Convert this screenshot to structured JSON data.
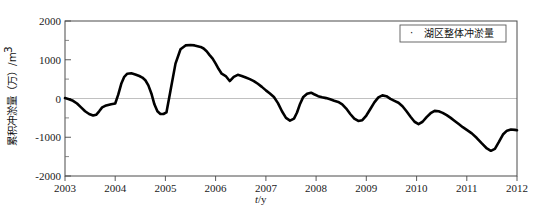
{
  "figure": {
    "background": "#ffffff",
    "series_color": "#000000",
    "axis_color": "#4a4a4a"
  },
  "legend": {
    "marker": "·",
    "label": "湖区整体冲淤量",
    "position": "top-right"
  },
  "axis": {
    "y_title": "累积冲淤量（万）/m³",
    "y_title_main": "累积冲淤量（万）/m",
    "y_title_sup": "3",
    "x_title_italic": "t",
    "x_title_rest": "/y"
  },
  "caption": {
    "text": ""
  },
  "chart_data": {
    "type": "line",
    "title": "",
    "subtitle": "",
    "xlabel": "t/y",
    "ylabel": "累积冲淤量（万）/m³",
    "xlim": [
      2003,
      2012
    ],
    "ylim": [
      -2000,
      2000
    ],
    "yticks": [
      -2000,
      -1000,
      0,
      1000,
      2000
    ],
    "ytick_labels": [
      "-2000",
      "-1000",
      "0",
      "1000",
      "2000"
    ],
    "yminor_step": 500,
    "xticks": [
      2003,
      2004,
      2005,
      2006,
      2007,
      2008,
      2009,
      2010,
      2011,
      2012
    ],
    "xtick_labels": [
      "2003",
      "2004",
      "2005",
      "2006",
      "2007",
      "2008",
      "2009",
      "2010",
      "2011",
      "2012"
    ],
    "grid": false,
    "legend_position": "upper right",
    "series": [
      {
        "name": "湖区整体冲淤量",
        "marker": "dot",
        "color": "#000000",
        "x": [
          2003.0,
          2003.08,
          2003.16,
          2003.24,
          2003.32,
          2003.4,
          2003.48,
          2003.56,
          2003.62,
          2003.68,
          2003.74,
          2003.8,
          2003.86,
          2003.92,
          2004.0,
          2004.06,
          2004.12,
          2004.18,
          2004.24,
          2004.32,
          2004.4,
          2004.48,
          2004.54,
          2004.6,
          2004.66,
          2004.72,
          2004.78,
          2004.84,
          2004.9,
          2004.96,
          2005.02,
          2005.1,
          2005.2,
          2005.3,
          2005.4,
          2005.5,
          2005.58,
          2005.64,
          2005.7,
          2005.76,
          2005.82,
          2005.88,
          2005.94,
          2006.0,
          2006.06,
          2006.12,
          2006.2,
          2006.28,
          2006.36,
          2006.44,
          2006.52,
          2006.6,
          2006.68,
          2006.76,
          2006.84,
          2006.92,
          2007.0,
          2007.08,
          2007.16,
          2007.24,
          2007.32,
          2007.4,
          2007.48,
          2007.56,
          2007.62,
          2007.68,
          2007.74,
          2007.82,
          2007.9,
          2007.96,
          2008.04,
          2008.12,
          2008.2,
          2008.28,
          2008.36,
          2008.44,
          2008.52,
          2008.6,
          2008.68,
          2008.76,
          2008.84,
          2008.92,
          2009.0,
          2009.08,
          2009.16,
          2009.24,
          2009.32,
          2009.4,
          2009.48,
          2009.56,
          2009.64,
          2009.72,
          2009.8,
          2009.88,
          2009.96,
          2010.04,
          2010.12,
          2010.2,
          2010.28,
          2010.36,
          2010.44,
          2010.52,
          2010.6,
          2010.68,
          2010.76,
          2010.84,
          2010.92,
          2011.0,
          2011.1,
          2011.2,
          2011.3,
          2011.4,
          2011.48,
          2011.56,
          2011.64,
          2011.72,
          2011.8,
          2011.88,
          2011.96,
          2012.0
        ],
        "y": [
          10,
          -20,
          -60,
          -130,
          -230,
          -330,
          -400,
          -440,
          -420,
          -330,
          -230,
          -190,
          -170,
          -150,
          -130,
          100,
          380,
          560,
          640,
          650,
          620,
          580,
          540,
          470,
          340,
          130,
          -150,
          -330,
          -400,
          -400,
          -360,
          200,
          900,
          1270,
          1370,
          1380,
          1370,
          1350,
          1330,
          1290,
          1220,
          1120,
          1030,
          900,
          760,
          640,
          580,
          450,
          560,
          610,
          580,
          540,
          500,
          450,
          380,
          300,
          210,
          130,
          40,
          -120,
          -330,
          -500,
          -570,
          -520,
          -360,
          -140,
          30,
          120,
          150,
          110,
          60,
          30,
          10,
          -20,
          -60,
          -90,
          -150,
          -260,
          -400,
          -520,
          -580,
          -560,
          -440,
          -270,
          -100,
          30,
          80,
          60,
          -10,
          -60,
          -110,
          -200,
          -330,
          -470,
          -600,
          -660,
          -600,
          -480,
          -380,
          -320,
          -330,
          -370,
          -430,
          -500,
          -580,
          -660,
          -740,
          -810,
          -900,
          -1020,
          -1160,
          -1290,
          -1350,
          -1300,
          -1120,
          -930,
          -830,
          -800,
          -810,
          -820
        ]
      }
    ]
  }
}
